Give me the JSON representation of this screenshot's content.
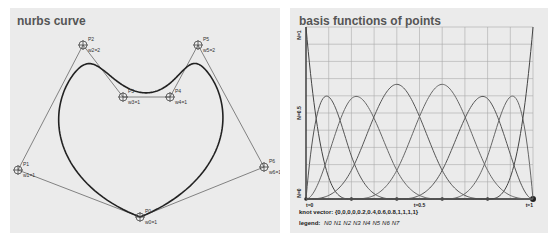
{
  "left_panel": {
    "title": "nurbs curve",
    "control_points": [
      {
        "name": "P0",
        "weight_label": "w0=1",
        "x": 130,
        "y": 209
      },
      {
        "name": "P1",
        "weight_label": "w1=1",
        "x": 8,
        "y": 162
      },
      {
        "name": "P2",
        "weight_label": "w2=2",
        "x": 73,
        "y": 37
      },
      {
        "name": "P3",
        "weight_label": "w3=1",
        "x": 113,
        "y": 89
      },
      {
        "name": "P4",
        "weight_label": "w4=1",
        "x": 160,
        "y": 89
      },
      {
        "name": "P5",
        "weight_label": "w5=2",
        "x": 188,
        "y": 37
      },
      {
        "name": "P6",
        "weight_label": "w6=1",
        "x": 254,
        "y": 159
      },
      {
        "name": "P7",
        "weight_label": "",
        "x": 130,
        "y": 209
      }
    ]
  },
  "right_panel": {
    "title": "basis functions of points",
    "y_labels": {
      "top": "N=1",
      "mid": "N=0.5",
      "bottom": "N=0"
    },
    "x_labels": {
      "left": "t=0",
      "mid": "t=0.5",
      "right": "t=1"
    },
    "knot_vector_label": "knot vector:",
    "knot_vector_value": "{0,0,0,0,0.2,0.4,0.6,0.8,1,1,1,1}",
    "legend_label": "legend:",
    "legend_items": [
      "N0",
      "N1",
      "N2",
      "N3",
      "N4",
      "N5",
      "N6",
      "N7"
    ]
  },
  "chart_data": {
    "type": "line",
    "title": "basis functions of points",
    "xlabel": "t",
    "ylabel": "N",
    "xlim": [
      0,
      1
    ],
    "ylim": [
      0,
      1
    ],
    "x_ticks": [
      "t=0",
      "t=0.5",
      "t=1"
    ],
    "y_ticks": [
      "N=0",
      "N=0.5",
      "N=1"
    ],
    "grid": true,
    "knot_vector": [
      0,
      0,
      0,
      0,
      0.2,
      0.4,
      0.6,
      0.8,
      1,
      1,
      1,
      1
    ],
    "degree": 3,
    "series": [
      {
        "name": "N0",
        "peak_t": 0.0,
        "peak_value": 1.0
      },
      {
        "name": "N1",
        "peak_t": 0.1,
        "peak_value": 0.58
      },
      {
        "name": "N2",
        "peak_t": 0.25,
        "peak_value": 0.58
      },
      {
        "name": "N3",
        "peak_t": 0.4,
        "peak_value": 0.67
      },
      {
        "name": "N4",
        "peak_t": 0.6,
        "peak_value": 0.67
      },
      {
        "name": "N5",
        "peak_t": 0.75,
        "peak_value": 0.58
      },
      {
        "name": "N6",
        "peak_t": 0.9,
        "peak_value": 0.58
      },
      {
        "name": "N7",
        "peak_t": 1.0,
        "peak_value": 1.0
      }
    ],
    "legend_position": "bottom"
  }
}
